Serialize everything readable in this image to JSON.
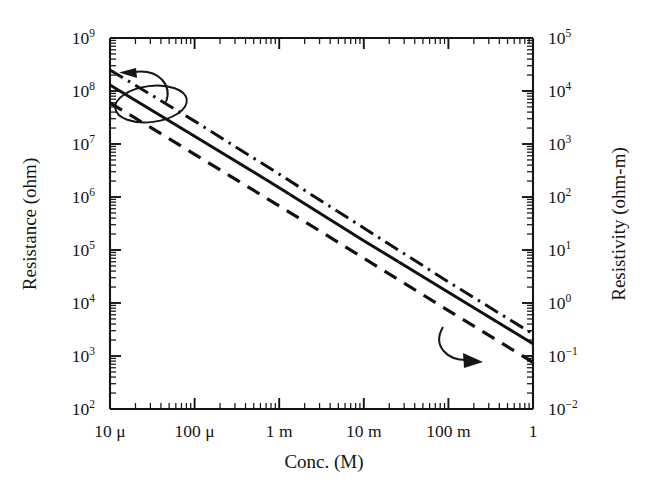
{
  "chart_data": {
    "type": "line",
    "title": "",
    "xlabel": "Conc. (M)",
    "ylabel": "Resistance (ohm)",
    "y2label": "Resistivity (ohm-m)",
    "xscale": "log",
    "yscale": "log",
    "xlim": [
      1e-05,
      1
    ],
    "ylim": [
      100,
      1000000000
    ],
    "y2lim": [
      0.01,
      100000
    ],
    "grid": false,
    "legend": "none",
    "x_tick_labels": [
      "10 μ",
      "100 μ",
      "1 m",
      "10 m",
      "100 m",
      "1"
    ],
    "x_tick_values": [
      1e-05,
      0.0001,
      0.001,
      0.01,
      0.1,
      1
    ],
    "y_tick_labels": [
      "10²",
      "10³",
      "10⁴",
      "10⁵",
      "10⁶",
      "10⁷",
      "10⁸",
      "10⁹"
    ],
    "y_tick_values": [
      100,
      1000,
      10000,
      100000,
      1000000,
      10000000,
      100000000,
      1000000000
    ],
    "y_tick_mantissas": [
      "10",
      "10",
      "10",
      "10",
      "10",
      "10",
      "10",
      "10"
    ],
    "y_tick_exponents": [
      "2",
      "3",
      "4",
      "5",
      "6",
      "7",
      "8",
      "9"
    ],
    "y2_tick_labels": [
      "10⁻²",
      "10⁻¹",
      "10⁰",
      "10¹",
      "10²",
      "10³",
      "10⁴",
      "10⁵"
    ],
    "y2_tick_values": [
      0.01,
      0.1,
      1,
      10,
      100,
      1000,
      10000,
      100000
    ],
    "y2_tick_mantissas": [
      "10",
      "10",
      "10",
      "10",
      "10",
      "10",
      "10",
      "10"
    ],
    "y2_tick_exponents": [
      "−2",
      "−1",
      "0",
      "1",
      "2",
      "3",
      "4",
      "5"
    ],
    "series": [
      {
        "name": "upper-bound",
        "style": "dash-dot",
        "x": [
          1e-05,
          1
        ],
        "y": [
          250000000,
          2600
        ],
        "points": [
          {
            "x": 1e-05,
            "y": 250000000
          },
          {
            "x": 0.0001,
            "y": 27000000
          },
          {
            "x": 0.001,
            "y": 2700000
          },
          {
            "x": 0.01,
            "y": 260000
          },
          {
            "x": 0.1,
            "y": 25000
          },
          {
            "x": 1,
            "y": 2600
          }
        ]
      },
      {
        "name": "nominal",
        "style": "solid",
        "x": [
          1e-05,
          1
        ],
        "y": [
          130000000,
          1700
        ],
        "points": [
          {
            "x": 1e-05,
            "y": 130000000
          },
          {
            "x": 0.0001,
            "y": 14000000
          },
          {
            "x": 0.001,
            "y": 1500000
          },
          {
            "x": 0.01,
            "y": 150000
          },
          {
            "x": 0.1,
            "y": 16000
          },
          {
            "x": 1,
            "y": 1700
          }
        ]
      },
      {
        "name": "lower-bound",
        "style": "dashed",
        "x": [
          1e-05,
          1
        ],
        "y": [
          60000000,
          760
        ],
        "points": [
          {
            "x": 1e-05,
            "y": 60000000
          },
          {
            "x": 0.0001,
            "y": 6400000
          },
          {
            "x": 0.001,
            "y": 680000
          },
          {
            "x": 0.01,
            "y": 70000
          },
          {
            "x": 0.1,
            "y": 7200
          },
          {
            "x": 1,
            "y": 760
          }
        ]
      }
    ],
    "annotations": [
      {
        "name": "left-axis-pointer",
        "kind": "curved-arrow",
        "direction": "left",
        "target_axis": "Resistance (ohm)"
      },
      {
        "name": "group-ellipse",
        "kind": "ellipse",
        "encircles": "series-group-left-end"
      },
      {
        "name": "right-axis-pointer",
        "kind": "curved-arrow",
        "direction": "down-right",
        "target_axis": "Resistivity (ohm-m)"
      }
    ]
  },
  "colors": {
    "ink": "#141414",
    "line": "#101010",
    "background": "#ffffff"
  }
}
